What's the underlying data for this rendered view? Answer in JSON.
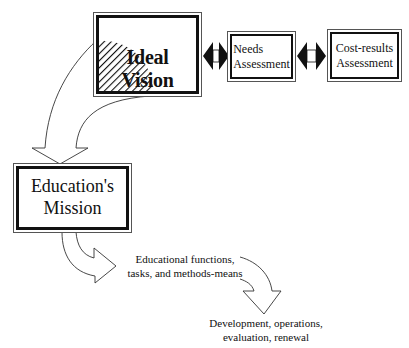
{
  "diagram": {
    "boxes": {
      "ideal_vision": {
        "label": "Ideal Vision"
      },
      "needs_assessment": {
        "line1": "Needs",
        "line2": "Assessment"
      },
      "cost_results": {
        "line1": "Cost-results",
        "line2": "Assessment"
      },
      "education_mission": {
        "line1": "Education's",
        "line2": "Mission"
      }
    },
    "texts": {
      "functions": {
        "line1": "Educational functions,",
        "line2": "tasks, and methods-means"
      },
      "development": {
        "line1": "Development, operations,",
        "line2": "evaluation, renewal"
      }
    },
    "connectors": [
      {
        "from": "ideal_vision",
        "to": "needs_assessment",
        "type": "double-arrow"
      },
      {
        "from": "needs_assessment",
        "to": "cost_results",
        "type": "double-arrow"
      },
      {
        "from": "ideal_vision",
        "to": "education_mission",
        "type": "curved-block-arrow"
      },
      {
        "from": "education_mission",
        "to": "functions",
        "type": "curved-block-arrow"
      },
      {
        "from": "functions",
        "to": "development",
        "type": "curved-block-arrow"
      }
    ],
    "colors": {
      "stroke": "#111111",
      "background": "#ffffff",
      "hatch": "#111111"
    }
  }
}
